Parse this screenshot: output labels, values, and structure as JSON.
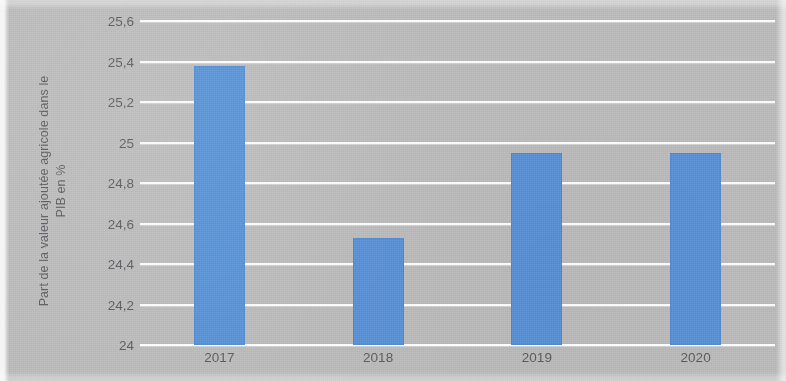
{
  "chart_data": {
    "type": "bar",
    "title": "",
    "subtitle": "",
    "xlabel": "",
    "ylabel": "Part de la valeur ajoutée agricole dans le PIB en %",
    "ylabel_lines": [
      "Part de la valeur ajoutée agricole dans le",
      "PIB en %"
    ],
    "categories": [
      "2017",
      "2018",
      "2019",
      "2020"
    ],
    "values": [
      25.38,
      24.53,
      24.95,
      24.95
    ],
    "series": [
      {
        "name": "Part de la valeur ajoutée agricole dans le PIB en %",
        "values": [
          25.38,
          24.53,
          24.95,
          24.95
        ]
      }
    ],
    "ylim": [
      24,
      25.6
    ],
    "ytick_labels": [
      "25,6",
      "25,4",
      "25,2",
      "25",
      "24,8",
      "24,6",
      "24,4",
      "24,2",
      "24"
    ],
    "ytick_values": [
      25.6,
      25.4,
      25.2,
      25,
      24.8,
      24.6,
      24.4,
      24.2,
      24
    ],
    "grid": true,
    "grid_color": "#ffffff",
    "legend": false,
    "legend_position": "none",
    "bar_color": "#5b8fd6",
    "background_color": "#b9b9ba",
    "text_color": "#5d5d61"
  }
}
